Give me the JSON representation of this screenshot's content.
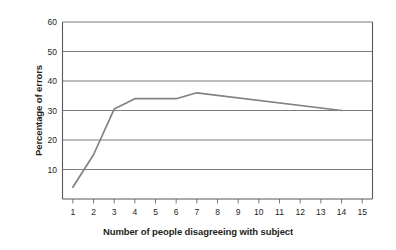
{
  "chart_data": {
    "type": "line",
    "title": "",
    "xlabel": "Number of people disagreeing with subject",
    "ylabel": "Percentage of errors",
    "xlim": [
      0.5,
      15.5
    ],
    "ylim": [
      0,
      60
    ],
    "xticks": [
      1,
      2,
      3,
      4,
      5,
      6,
      7,
      8,
      9,
      10,
      11,
      12,
      13,
      14,
      15
    ],
    "xtick_labels": [
      "1",
      "2",
      "3",
      "4",
      "5",
      "6",
      "7",
      "8",
      "9",
      "10",
      "11",
      "12",
      "13",
      "14",
      "15"
    ],
    "yticks": [
      10,
      20,
      30,
      40,
      50,
      60
    ],
    "ytick_labels": [
      "10",
      "20",
      "30",
      "40",
      "50",
      "60"
    ],
    "grid": "horizontal",
    "legend": "none",
    "x": [
      1,
      2,
      3,
      4,
      5,
      6,
      7,
      14
    ],
    "values": [
      4,
      15,
      30.5,
      34,
      34,
      34,
      36,
      30
    ],
    "series": [
      {
        "name": "Percentage of errors",
        "color": "#808285",
        "x": [
          1,
          2,
          3,
          4,
          5,
          6,
          7,
          14
        ],
        "values": [
          4,
          15,
          30.5,
          34,
          34,
          34,
          36,
          30
        ]
      }
    ]
  },
  "colors": {
    "line": "#808285",
    "grid": "#6d6e71",
    "axis": "#58595b",
    "text": "#231f20",
    "background": "#ffffff"
  }
}
